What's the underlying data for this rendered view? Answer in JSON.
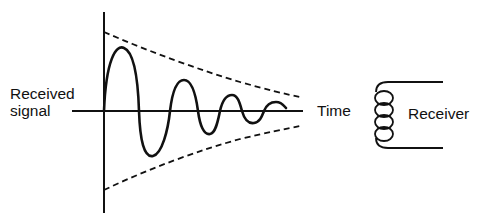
{
  "diagram": {
    "labels": {
      "y_axis_line1": "Received",
      "y_axis_line2": "signal",
      "x_axis": "Time",
      "receiver": "Receiver"
    },
    "elements": {
      "signal": "damped oscillation (solid curve)",
      "envelope": "exponential decay envelope (dashed curves)",
      "receiver_icon": "coil-icon"
    },
    "colors": {
      "stroke": "#111111",
      "background": "#ffffff"
    }
  }
}
